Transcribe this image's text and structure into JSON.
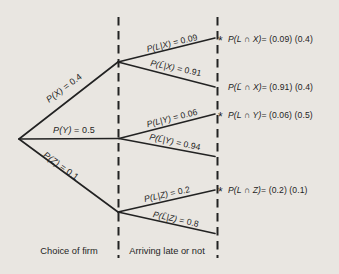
{
  "colors": {
    "background": "#e9e6e1",
    "ink": "#1f1f1f"
  },
  "tree": {
    "branch_labels": [
      {
        "expr": "P(X)",
        "val": " = 0.4"
      },
      {
        "expr": "P(Y)",
        "val": " = 0.5"
      },
      {
        "expr": "P(Z)",
        "val": " = 0.1"
      }
    ],
    "conditional_labels": [
      {
        "expr": "P(L|X)",
        "val": " = 0.09"
      },
      {
        "expr": "P(L̄|X)",
        "val": " = 0.91"
      },
      {
        "expr": "P(L|Y)",
        "val": " = 0.06"
      },
      {
        "expr": "P(L̄|Y)",
        "val": " = 0.94"
      },
      {
        "expr": "P(L|Z)",
        "val": " = 0.2"
      },
      {
        "expr": "P(L̄|Z)",
        "val": " = 0.8"
      }
    ],
    "outcomes": [
      {
        "bullet": "*",
        "expr": "P(L ∩ X)",
        "val": " = (0.09) (0.4)"
      },
      {
        "bullet": "",
        "expr": "P(L̄ ∩ X)",
        "val": " = (0.91) (0.4)"
      },
      {
        "bullet": "*",
        "expr": "P(L ∩ Y)",
        "val": " = (0.06) (0.5)"
      },
      {
        "bullet": "*",
        "expr": "P(L ∩ Z)",
        "val": " = (0.2) (0.1)"
      }
    ],
    "stage_labels": [
      "Choice of firm",
      "Arriving late or not"
    ]
  }
}
